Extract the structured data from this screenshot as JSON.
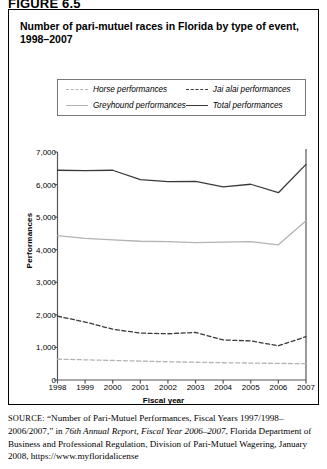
{
  "figure": {
    "label": "FIGURE 6.5",
    "title": "Number of pari-mutuel races in Florida by type of event, 1998–2007"
  },
  "legend": {
    "items": [
      {
        "label": "Horse performances",
        "style": "dashed",
        "color": "#b3b3b3",
        "key": "horse"
      },
      {
        "label": "Jai alai performances",
        "style": "dashed",
        "color": "#3a3a3a",
        "key": "jai_alai"
      },
      {
        "label": "Greyhound performances",
        "style": "solid",
        "color": "#b3b3b3",
        "key": "greyhound"
      },
      {
        "label": "Total performances",
        "style": "solid",
        "color": "#3a3a3a",
        "key": "total"
      }
    ]
  },
  "axes": {
    "xlabel": "Fiscal year",
    "ylabel": "Performances",
    "yticks": [
      "0",
      "1,000",
      "2,000",
      "3,000",
      "4,000",
      "5,000",
      "6,000",
      "7,000"
    ],
    "xticks": [
      "1998",
      "1999",
      "2000",
      "2001",
      "2002",
      "2003",
      "2004",
      "2005",
      "2006",
      "2007"
    ]
  },
  "source": {
    "prefix": "SOURCE:",
    "part1": " “Number of Pari-Mutuel Performances, Fiscal Years 1997/1998–2006/2007,” in ",
    "italic": "76th Annual Report, Fiscal Year 2006–2007",
    "part2": ", Florida Department of Business and Professional Regulation, Division of Pari-Mutuel Wagering, January 2008, https://www.myfloridalicense"
  },
  "chart_data": {
    "type": "line",
    "title": "Number of pari-mutuel races in Florida by type of event, 1998–2007",
    "xlabel": "Fiscal year",
    "ylabel": "Performances",
    "x": [
      1998,
      1999,
      2000,
      2001,
      2002,
      2003,
      2004,
      2005,
      2006,
      2007
    ],
    "xlim": [
      1998,
      2007
    ],
    "ylim": [
      0,
      7000
    ],
    "ytick_step": 1000,
    "grid": false,
    "legend_position": "top",
    "series": [
      {
        "name": "Horse performances",
        "color": "#b3b3b3",
        "style": "dashed",
        "values": [
          640,
          620,
          600,
          580,
          560,
          545,
          530,
          520,
          510,
          500
        ]
      },
      {
        "name": "Greyhound performances",
        "color": "#b3b3b3",
        "style": "solid",
        "values": [
          4430,
          4350,
          4300,
          4260,
          4250,
          4220,
          4230,
          4250,
          4150,
          4890
        ]
      },
      {
        "name": "Jai alai performances",
        "color": "#3a3a3a",
        "style": "dashed",
        "values": [
          1960,
          1780,
          1560,
          1440,
          1420,
          1460,
          1230,
          1200,
          1050,
          1330
        ]
      },
      {
        "name": "Total performances",
        "color": "#3a3a3a",
        "style": "solid",
        "values": [
          6440,
          6430,
          6440,
          6150,
          6090,
          6100,
          5930,
          6010,
          5750,
          6620
        ]
      }
    ]
  }
}
